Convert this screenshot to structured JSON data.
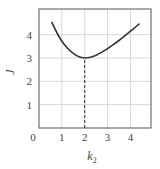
{
  "chart_data": {
    "type": "line",
    "title": "",
    "xlabel": "k",
    "xlabel_subscript": "2",
    "ylabel": "J",
    "xlim": [
      0,
      4.9
    ],
    "ylim": [
      0,
      5.1
    ],
    "xticks": [
      "0",
      "1",
      "2",
      "3",
      "4"
    ],
    "yticks": [
      "1",
      "2",
      "3",
      "4"
    ],
    "grid": true,
    "legend": null,
    "series": [
      {
        "name": "J(k2)",
        "x": [
          0.55,
          0.8,
          1.0,
          1.25,
          1.5,
          1.75,
          2.0,
          2.25,
          2.5,
          2.75,
          3.0,
          3.25,
          3.5,
          3.75,
          4.0,
          4.25,
          4.4
        ],
        "y": [
          4.55,
          4.05,
          3.72,
          3.42,
          3.2,
          3.05,
          3.0,
          3.03,
          3.12,
          3.25,
          3.4,
          3.57,
          3.75,
          3.95,
          4.15,
          4.35,
          4.47
        ]
      }
    ],
    "annotations": [
      {
        "type": "dashed-vertical-line",
        "x": 2,
        "from_y": 0,
        "to_y": 3,
        "label": "minimum at k2 = 2, J = 3"
      }
    ]
  },
  "axes": {
    "x_origin_label": "0",
    "x_label": "k",
    "x_label_sub": "2",
    "y_label": "J"
  }
}
